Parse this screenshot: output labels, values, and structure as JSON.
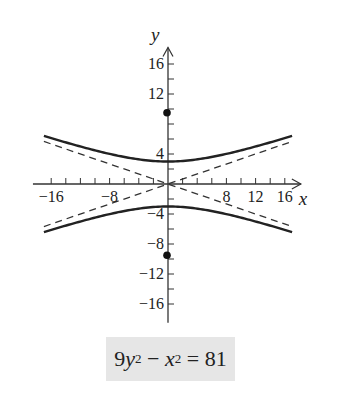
{
  "chart_data": {
    "type": "line",
    "title": "",
    "equation": "9y^2 - x^2 = 81",
    "equation_parts": {
      "coef": "9",
      "var1": "y",
      "exp1": "2",
      "minus": " − ",
      "var2": "x",
      "exp2": "2",
      "rhs": " = 81"
    },
    "xlabel": "x",
    "ylabel": "y",
    "xlim": [
      -18,
      18
    ],
    "ylim": [
      -19,
      19
    ],
    "x_ticks": [
      -16,
      -8,
      8,
      12,
      16
    ],
    "x_tick_labels": [
      "−16",
      "−8",
      "8",
      "12",
      "16"
    ],
    "x_minor_tick_step": 2,
    "y_ticks": [
      16,
      12,
      4,
      -4,
      -8,
      -12,
      -16
    ],
    "y_tick_labels": [
      "16",
      "12",
      "4",
      "−4",
      "−8",
      "−12",
      "−16"
    ],
    "y_minor_tick_step": 2,
    "grid": false,
    "series": [
      {
        "name": "upper branch",
        "style": "solid",
        "equation": "y = sqrt(9 + x^2/9)",
        "x_range": [
          -17,
          17
        ],
        "points": [
          [
            -17,
            6.42
          ],
          [
            -12,
            5.0
          ],
          [
            -8,
            4.01
          ],
          [
            -4,
            3.28
          ],
          [
            0,
            3
          ],
          [
            4,
            3.28
          ],
          [
            8,
            4.01
          ],
          [
            12,
            5.0
          ],
          [
            17,
            6.42
          ]
        ]
      },
      {
        "name": "lower branch",
        "style": "solid",
        "equation": "y = -sqrt(9 + x^2/9)",
        "x_range": [
          -17,
          17
        ],
        "points": [
          [
            -17,
            -6.42
          ],
          [
            -12,
            -5.0
          ],
          [
            -8,
            -4.01
          ],
          [
            -4,
            -3.28
          ],
          [
            0,
            -3
          ],
          [
            4,
            -3.28
          ],
          [
            8,
            -4.01
          ],
          [
            12,
            -5.0
          ],
          [
            17,
            -6.42
          ]
        ]
      },
      {
        "name": "asymptote y = x/3",
        "style": "dashed",
        "points": [
          [
            -17,
            -5.67
          ],
          [
            17,
            5.67
          ]
        ]
      },
      {
        "name": "asymptote y = -x/3",
        "style": "dashed",
        "points": [
          [
            -17,
            5.67
          ],
          [
            17,
            -5.67
          ]
        ]
      }
    ],
    "points": [
      {
        "name": "focus",
        "x": 0,
        "y": 9.49
      },
      {
        "name": "focus",
        "x": 0,
        "y": -9.49
      }
    ],
    "layout": {
      "origin_px": [
        168,
        184
      ],
      "px_per_unit_x": 7.3,
      "px_per_unit_y": 7.5
    }
  }
}
